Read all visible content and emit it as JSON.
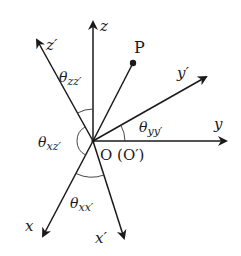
{
  "diagram": {
    "type": "coordinate-rotation",
    "origin_label": "O (O′)",
    "point_label": "P",
    "axes": [
      {
        "name": "x",
        "label": "x"
      },
      {
        "name": "y",
        "label": "y"
      },
      {
        "name": "z",
        "label": "z"
      },
      {
        "name": "x_prime",
        "label": "x′"
      },
      {
        "name": "y_prime",
        "label": "y′"
      },
      {
        "name": "z_prime",
        "label": "z′"
      }
    ],
    "angles": [
      {
        "name": "theta_zz",
        "symbol": "θ",
        "subscript": "zz′"
      },
      {
        "name": "theta_yy",
        "symbol": "θ",
        "subscript": "yy′"
      },
      {
        "name": "theta_xz",
        "symbol": "θ",
        "subscript": "xz′"
      },
      {
        "name": "theta_xx",
        "symbol": "θ",
        "subscript": "xx′"
      }
    ],
    "colors": {
      "ink": "#1a1a1a",
      "background": "#ffffff"
    }
  }
}
